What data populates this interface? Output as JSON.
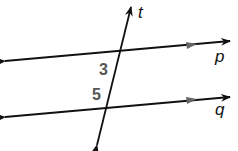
{
  "diagram": {
    "type": "parallel-lines-transversal",
    "lines": [
      {
        "id": "p",
        "label": "p",
        "x1": 5,
        "y1": 61,
        "x2": 230,
        "y2": 41
      },
      {
        "id": "q",
        "label": "q",
        "x1": 5,
        "y1": 117,
        "x2": 230,
        "y2": 96
      }
    ],
    "transversal": {
      "id": "t",
      "label": "t",
      "x1": 97,
      "y1": 145,
      "x2": 131,
      "y2": 7
    },
    "angles": [
      {
        "label": "3",
        "x": 100,
        "y": 78
      },
      {
        "label": "5",
        "x": 92,
        "y": 103
      }
    ],
    "colors": {
      "line": "#111111",
      "angle_label": "#555555",
      "marker": "#666666"
    }
  }
}
